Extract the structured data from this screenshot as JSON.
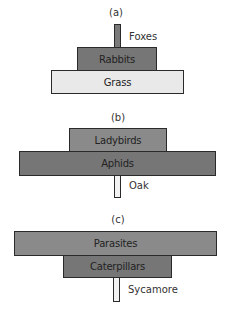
{
  "diagram": {
    "panels": [
      {
        "id": "a",
        "label": "(a)",
        "levels": [
          {
            "name": "Foxes",
            "trophic_level": 3,
            "relative_width": "smallest",
            "shade": "dark",
            "label_position": "right"
          },
          {
            "name": "Rabbits",
            "trophic_level": 2,
            "relative_width": "medium",
            "shade": "dark",
            "label_position": "inside"
          },
          {
            "name": "Grass",
            "trophic_level": 1,
            "relative_width": "widest",
            "shade": "light",
            "label_position": "inside"
          }
        ]
      },
      {
        "id": "b",
        "label": "(b)",
        "levels": [
          {
            "name": "Ladybirds",
            "trophic_level": 3,
            "relative_width": "medium",
            "shade": "mid",
            "label_position": "inside"
          },
          {
            "name": "Aphids",
            "trophic_level": 2,
            "relative_width": "widest",
            "shade": "dark",
            "label_position": "inside"
          },
          {
            "name": "Oak",
            "trophic_level": 1,
            "relative_width": "smallest",
            "shade": "light",
            "label_position": "right"
          }
        ]
      },
      {
        "id": "c",
        "label": "(c)",
        "levels": [
          {
            "name": "Parasites",
            "trophic_level": 3,
            "relative_width": "widest",
            "shade": "mid",
            "label_position": "inside"
          },
          {
            "name": "Caterpillars",
            "trophic_level": 2,
            "relative_width": "medium",
            "shade": "dark",
            "label_position": "inside"
          },
          {
            "name": "Sycamore",
            "trophic_level": 1,
            "relative_width": "smallest",
            "shade": "light",
            "label_position": "right"
          }
        ]
      }
    ]
  }
}
